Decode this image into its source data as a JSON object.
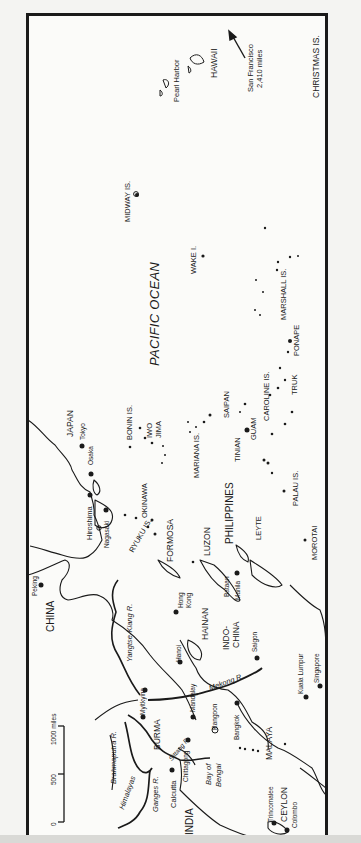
{
  "map": {
    "orientation": "rotated 90° counter-clockwise",
    "ocean": "PACIFIC OCEAN",
    "countries_regions": [
      "CHINA",
      "JAPAN",
      "INDIA",
      "BURMA",
      "MALAYA",
      "INDO-CHINA",
      "PHILIPPINES",
      "FORMOSA",
      "HAINAN",
      "CEYLON"
    ],
    "islands": [
      "HAWAII",
      "CHRISTMAS IS.",
      "MIDWAY IS.",
      "WAKE I.",
      "MARSHALL IS.",
      "BONIN IS.",
      "IWO JIMA",
      "OKINAWA",
      "RYUKU IS.",
      "MARIANA IS.",
      "SAIPAN",
      "TINIAN",
      "GUAM",
      "CAROLINE IS.",
      "TRUK",
      "PONAPE",
      "PALAU IS.",
      "LEYTE",
      "LUZON",
      "MOROTAI"
    ],
    "cities": [
      "Pearl Harbor",
      "Tokyo",
      "Osaka",
      "Hiroshima",
      "Nagasaki",
      "Peking",
      "Hong Kong",
      "Hanoi",
      "Saigon",
      "Bataan",
      "Manila",
      "Kuala Lumpur",
      "Singapore",
      "Bangkok",
      "Rangoon",
      "Mandalay",
      "Myitkyina",
      "Chittagong",
      "Calcutta",
      "Trincomalee",
      "Colombo"
    ],
    "rivers": [
      "Yangtse-Kiang R.",
      "Mekong R.",
      "Sittang R.",
      "Brahmaputra R.",
      "Ganges R."
    ],
    "other_features": [
      "Himalayas",
      "Bay of Bengal"
    ],
    "arrow_note": {
      "line1": "San Francisco",
      "line2": "2,410 miles"
    },
    "scale_bar": {
      "ticks": [
        "0",
        "500",
        "1000 miles"
      ]
    }
  },
  "labels": {
    "hawaii": "HAWAII",
    "pearl_harbor": "Pearl Harbor",
    "sf1": "San Francisco",
    "sf2": "2,410 miles",
    "christmas": "CHRISTMAS IS.",
    "midway": "MIDWAY IS.",
    "wake": "WAKE I.",
    "marshall": "MARSHALL IS.",
    "pacific": "PACIFIC OCEAN",
    "ponape": "PONAPE",
    "truk": "TRUK",
    "caroline": "CAROLINE IS.",
    "saipan": "SAIPAN",
    "tinian": "TINIAN",
    "guam": "GUAM",
    "bonin": "BONIN IS.",
    "iwo": "IWO",
    "jima": "JIMA",
    "japan": "JAPAN",
    "tokyo": "Tokyo",
    "osaka": "Osaka",
    "hiroshima": "Hiroshima",
    "nagasaki": "Nagasaki",
    "okinawa": "OKINAWA",
    "ryuku": "RYUKU IS.",
    "mariana": "MARIANA IS.",
    "formosa": "FORMOSA",
    "luzon": "LUZON",
    "philippines": "PHILIPPINES",
    "leyte": "LEYTE",
    "palau": "PALAU IS.",
    "morotai": "MOROTAI",
    "peking": "Peking",
    "china": "CHINA",
    "yangtse": "Yangtse-Kiang R.",
    "hong": "Hong",
    "kong": "Kong",
    "hainan": "HAINAN",
    "bataan": "Bataan",
    "manila": "Manila",
    "indo": "INDO-",
    "china2": "CHINA",
    "hanoi": "Hanoi",
    "saigon": "Saigon",
    "mekong": "Mekong R.",
    "kuala": "Kuala Lumpur",
    "singapore": "Singapore",
    "myitkyina": "Myitkyina",
    "mandalay": "Mandalay",
    "rangoon": "Rangoon",
    "bangkok": "Bangkok",
    "burma": "BURMA",
    "sittang": "Sittang R.",
    "malaya": "MALAYA",
    "brahmaputra": "Brahmaputra R.",
    "himalayas": "Himalayas",
    "ganges": "Ganges R.",
    "calcutta": "Calcutta",
    "chittagong": "Chittagong",
    "bay": "Bay of",
    "bengal": "Bengal",
    "india": "INDIA",
    "ceylon": "CEYLON",
    "trincomalee": "Trincomalee",
    "colombo": "Colombo",
    "scale0": "0",
    "scale500": "500",
    "scale1000": "1000 miles"
  }
}
